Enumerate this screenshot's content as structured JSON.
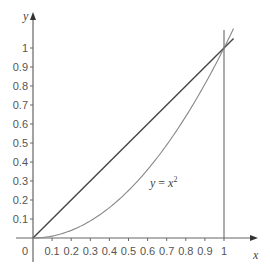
{
  "chart_data": {
    "type": "line",
    "title": "",
    "xlabel": "x",
    "ylabel": "y",
    "xlim": [
      0,
      1.05
    ],
    "ylim": [
      0,
      1.1
    ],
    "grid": false,
    "legend": null,
    "x_ticks": [
      "0.1",
      "0.2",
      "0.3",
      "0.4",
      "0.5",
      "0.6",
      "0.7",
      "0.8",
      "0.9",
      "1"
    ],
    "y_ticks": [
      "0.1",
      "0.2",
      "0.3",
      "0.4",
      "0.5",
      "0.6",
      "0.7",
      "0.8",
      "0.9",
      "1"
    ],
    "origin_label": "0",
    "series": [
      {
        "name": "y = x",
        "x": [
          0,
          1.05
        ],
        "y": [
          0,
          1.05
        ],
        "color": "#444444"
      },
      {
        "name": "y = x^2",
        "x": [
          0,
          0.1,
          0.2,
          0.3,
          0.4,
          0.5,
          0.6,
          0.7,
          0.8,
          0.9,
          1.0,
          1.05
        ],
        "y": [
          0,
          0.01,
          0.04,
          0.09,
          0.16,
          0.25,
          0.36,
          0.49,
          0.64,
          0.81,
          1.0,
          1.1025
        ],
        "color": "#888888"
      },
      {
        "name": "x = 1",
        "x": [
          1,
          1
        ],
        "y": [
          0,
          1.1
        ],
        "color": "#666666"
      }
    ],
    "annotations": [
      {
        "text": "y = x²",
        "x": 0.6,
        "y": 0.32
      }
    ]
  },
  "labels": {
    "x_axis": "x",
    "y_axis": "y",
    "origin": "0",
    "curve_y": "y",
    "curve_eq": " = ",
    "curve_x": "x",
    "curve_exp": "2"
  }
}
